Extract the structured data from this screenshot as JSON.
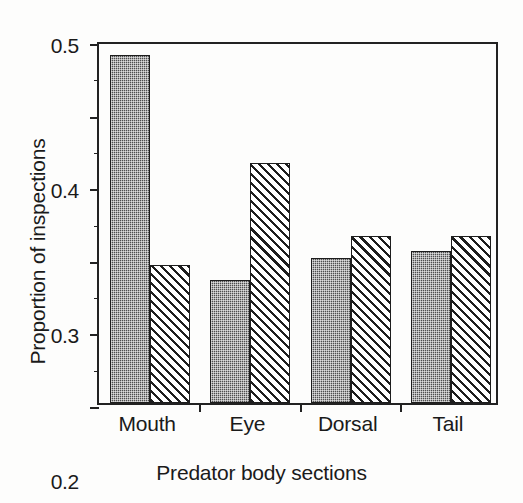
{
  "chart_data": {
    "type": "bar",
    "title": "",
    "xlabel": "Predator body sections",
    "ylabel": "Proportion of inspections",
    "categories": [
      "Mouth",
      "Eye",
      "Dorsal",
      "Tail"
    ],
    "series": [
      {
        "name": "dark-stippled",
        "pattern": "stipple",
        "color": "#4e4e4e",
        "values": [
          0.48,
          0.17,
          0.2,
          0.21
        ]
      },
      {
        "name": "diagonal-hatched",
        "pattern": "diagonal-hatch",
        "color": "#ffffff",
        "values": [
          0.19,
          0.33,
          0.23,
          0.23
        ]
      }
    ],
    "ylim": [
      0.0,
      0.5
    ],
    "ytick_values": [
      0.0,
      0.1,
      0.2,
      0.3,
      0.4,
      0.5
    ],
    "ytick_labels": [
      "0.0",
      "0.1",
      "0.2",
      "0.3",
      "0.4",
      "0.5"
    ],
    "yminor_tick_values": [
      0.05,
      0.15,
      0.25,
      0.35,
      0.45
    ],
    "grid": false,
    "legend": "none",
    "axis_color": "#222222"
  }
}
